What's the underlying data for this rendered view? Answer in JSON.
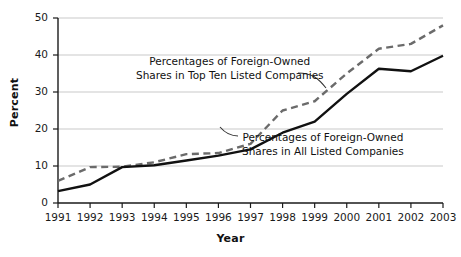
{
  "chart_data": {
    "type": "line",
    "title": "",
    "xlabel": "Year",
    "ylabel": "Percent",
    "x": [
      1991,
      1992,
      1993,
      1994,
      1995,
      1996,
      1997,
      1998,
      1999,
      2000,
      2001,
      2002,
      2003
    ],
    "xtick_labels": [
      "1991",
      "1992",
      "1993",
      "1994",
      "1995",
      "1996",
      "1997",
      "1998",
      "1999",
      "2000",
      "2001",
      "2002",
      "2003"
    ],
    "ytick_labels": [
      "0",
      "10",
      "20",
      "30",
      "40",
      "50"
    ],
    "yticks": [
      0,
      10,
      20,
      30,
      40,
      50
    ],
    "ylim": [
      0,
      50
    ],
    "xlim": [
      1991,
      2003
    ],
    "grid": "horizontal",
    "legend_position": "inline-annotations",
    "series": [
      {
        "name": "Percentages of Foreign-Owned Shares in Top Ten Listed Companies",
        "style": "dashed",
        "color": "#6b6b6b",
        "values": [
          6.0,
          9.7,
          9.8,
          11.0,
          13.2,
          13.5,
          16.0,
          25.0,
          27.5,
          35.0,
          41.7,
          43.0,
          48.0
        ]
      },
      {
        "name": "Percentages of Foreign-Owned Shares in All Listed Companies",
        "style": "solid",
        "color": "#111111",
        "values": [
          3.2,
          5.0,
          9.7,
          10.2,
          11.5,
          12.8,
          14.5,
          19.0,
          22.0,
          29.5,
          36.3,
          35.6,
          39.8
        ]
      }
    ],
    "annotations": [
      {
        "id": "topten",
        "line1": "Percentages of Foreign-Owned",
        "line2": "Shares in Top Ten Listed Companies",
        "target_series": "Percentages of Foreign-Owned Shares in Top Ten Listed Companies"
      },
      {
        "id": "all",
        "line1": "Percentages of Foreign-Owned",
        "line2": "Shares in All Listed Companies",
        "target_series": "Percentages of Foreign-Owned Shares in All Listed Companies"
      }
    ]
  },
  "axes": {
    "y_title": "Percent",
    "x_title": "Year"
  },
  "colors": {
    "gridline": "#c9c9c9",
    "axis": "#1a1a1a",
    "solid_series": "#111111",
    "dashed_series": "#6b6b6b",
    "background": "#ffffff"
  }
}
